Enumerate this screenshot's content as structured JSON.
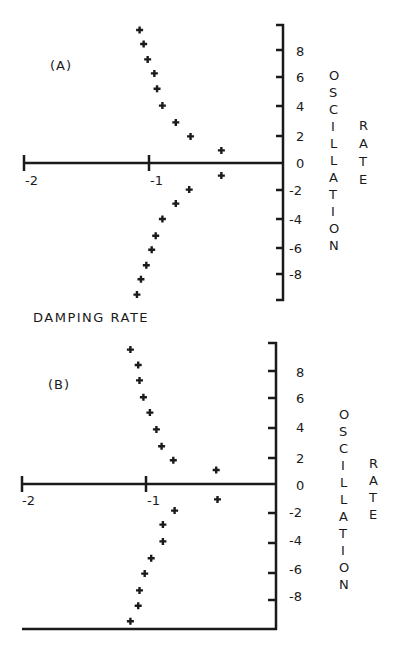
{
  "chart_data": [
    {
      "type": "scatter",
      "panel_label": "(A)",
      "title": "",
      "xlabel": "DAMPING RATE",
      "ylabel": "OSCILLATION RATE",
      "xlim": [
        -2,
        0
      ],
      "ylim": [
        -10,
        10
      ],
      "x_ticks": [
        -2,
        -1
      ],
      "x_tick_labels": [
        "-2",
        "-1"
      ],
      "y_ticks": [
        8,
        6,
        4,
        2,
        0,
        -2,
        -4,
        -6,
        -8
      ],
      "y_tick_labels": [
        "8",
        "6",
        "4",
        "2",
        "0",
        "-2",
        "-4",
        "-6",
        "-8"
      ],
      "grid": false,
      "legend": null,
      "marker": "+",
      "series": [
        {
          "name": "poles",
          "points": [
            {
              "x": -1.07,
              "y": 9.5
            },
            {
              "x": -1.04,
              "y": 8.5
            },
            {
              "x": -1.01,
              "y": 7.4
            },
            {
              "x": -0.96,
              "y": 6.4
            },
            {
              "x": -0.94,
              "y": 5.3
            },
            {
              "x": -0.9,
              "y": 4.1
            },
            {
              "x": -0.8,
              "y": 2.9
            },
            {
              "x": -0.69,
              "y": 1.9
            },
            {
              "x": -0.46,
              "y": 0.9
            },
            {
              "x": -0.46,
              "y": -0.9
            },
            {
              "x": -0.7,
              "y": -1.9
            },
            {
              "x": -0.8,
              "y": -2.9
            },
            {
              "x": -0.9,
              "y": -4.0
            },
            {
              "x": -0.95,
              "y": -5.2
            },
            {
              "x": -0.98,
              "y": -6.2
            },
            {
              "x": -1.02,
              "y": -7.3
            },
            {
              "x": -1.06,
              "y": -8.3
            },
            {
              "x": -1.09,
              "y": -9.4
            }
          ]
        }
      ]
    },
    {
      "type": "scatter",
      "panel_label": "(B)",
      "title": "",
      "xlabel": "",
      "ylabel": "OSCILLATION RATE",
      "xlim": [
        -2,
        0
      ],
      "ylim": [
        -10,
        10
      ],
      "x_ticks": [
        -2,
        -1
      ],
      "x_tick_labels": [
        "-2",
        "-1"
      ],
      "y_ticks": [
        8,
        6,
        4,
        2,
        0,
        -2,
        -4,
        -6,
        -8
      ],
      "y_tick_labels": [
        "8",
        "6",
        "4",
        "2",
        "0",
        "-2",
        "-4",
        "-6",
        "-8"
      ],
      "grid": false,
      "legend": null,
      "marker": "+",
      "series": [
        {
          "name": "poles",
          "points": [
            {
              "x": -1.12,
              "y": 9.6
            },
            {
              "x": -1.06,
              "y": 8.5
            },
            {
              "x": -1.05,
              "y": 7.4
            },
            {
              "x": -1.02,
              "y": 6.2
            },
            {
              "x": -0.97,
              "y": 5.1
            },
            {
              "x": -0.92,
              "y": 3.9
            },
            {
              "x": -0.88,
              "y": 2.7
            },
            {
              "x": -0.79,
              "y": 1.7
            },
            {
              "x": -0.46,
              "y": 1.0
            },
            {
              "x": -0.45,
              "y": -1.1
            },
            {
              "x": -0.78,
              "y": -1.9
            },
            {
              "x": -0.87,
              "y": -2.9
            },
            {
              "x": -0.87,
              "y": -4.1
            },
            {
              "x": -0.96,
              "y": -5.3
            },
            {
              "x": -1.01,
              "y": -6.4
            },
            {
              "x": -1.05,
              "y": -7.6
            },
            {
              "x": -1.06,
              "y": -8.7
            },
            {
              "x": -1.12,
              "y": -9.8
            }
          ]
        }
      ]
    }
  ],
  "panels": {
    "a": {
      "label": "(A)",
      "xlabel": "DAMPING RATE",
      "ylabel_word1": [
        "O",
        "S",
        "C",
        "I",
        "L",
        "L",
        "A",
        "T",
        "I",
        "O",
        "N"
      ],
      "ylabel_word2": [
        "R",
        "A",
        "T",
        "E"
      ],
      "x_tick_labels": [
        "-2",
        "-1"
      ],
      "y_tick_labels": [
        "8",
        "6",
        "4",
        "2",
        "0",
        "-2",
        "-4",
        "-6",
        "-8"
      ]
    },
    "b": {
      "label": "(B)",
      "ylabel_word1": [
        "O",
        "S",
        "C",
        "I",
        "L",
        "L",
        "A",
        "T",
        "I",
        "O",
        "N"
      ],
      "ylabel_word2": [
        "R",
        "A",
        "T",
        "E"
      ],
      "x_tick_labels": [
        "-2",
        "-1"
      ],
      "y_tick_labels": [
        "8",
        "6",
        "4",
        "2",
        "0",
        "-2",
        "-4",
        "-6",
        "-8"
      ]
    }
  },
  "colors": {
    "ink": "#1a1a1a",
    "background": "#ffffff"
  }
}
